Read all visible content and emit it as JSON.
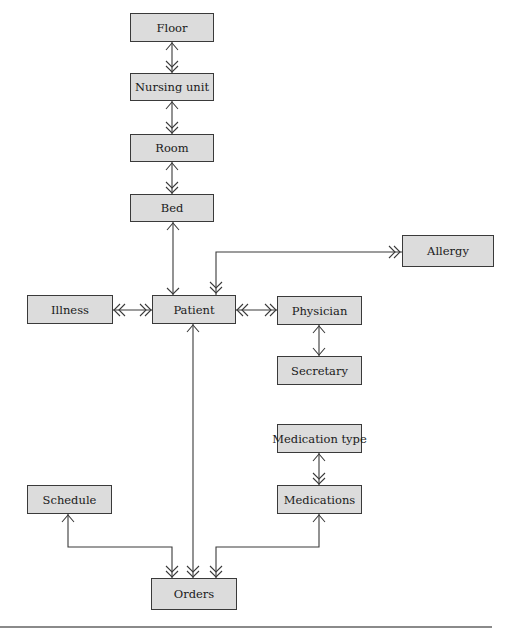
{
  "diagram": {
    "type": "entity-relationship (crow's-foot style)",
    "entities": [
      {
        "id": "floor",
        "label": "Floor",
        "x": 130,
        "y": 13,
        "w": 84,
        "h": 29
      },
      {
        "id": "nursing_unit",
        "label": "Nursing unit",
        "x": 130,
        "y": 73,
        "w": 84,
        "h": 28
      },
      {
        "id": "room",
        "label": "Room",
        "x": 130,
        "y": 134,
        "w": 84,
        "h": 28
      },
      {
        "id": "bed",
        "label": "Bed",
        "x": 130,
        "y": 194,
        "w": 84,
        "h": 28
      },
      {
        "id": "allergy",
        "label": "Allergy",
        "x": 402,
        "y": 235,
        "w": 92,
        "h": 32
      },
      {
        "id": "illness",
        "label": "Illness",
        "x": 27,
        "y": 295,
        "w": 86,
        "h": 29
      },
      {
        "id": "patient",
        "label": "Patient",
        "x": 152,
        "y": 295,
        "w": 84,
        "h": 29
      },
      {
        "id": "physician",
        "label": "Physician",
        "x": 277,
        "y": 296,
        "w": 85,
        "h": 29
      },
      {
        "id": "secretary",
        "label": "Secretary",
        "x": 277,
        "y": 356,
        "w": 85,
        "h": 29
      },
      {
        "id": "medication_type",
        "label": "Medication type",
        "x": 277,
        "y": 424,
        "w": 85,
        "h": 29
      },
      {
        "id": "schedule",
        "label": "Schedule",
        "x": 27,
        "y": 485,
        "w": 85,
        "h": 29
      },
      {
        "id": "medications",
        "label": "Medications",
        "x": 277,
        "y": 485,
        "w": 85,
        "h": 29
      },
      {
        "id": "orders",
        "label": "Orders",
        "x": 151,
        "y": 578,
        "w": 86,
        "h": 32
      }
    ],
    "relationships": [
      {
        "from": "floor",
        "to": "nursing_unit",
        "cardinality": "one-to-many"
      },
      {
        "from": "nursing_unit",
        "to": "room",
        "cardinality": "one-to-many"
      },
      {
        "from": "room",
        "to": "bed",
        "cardinality": "one-to-many"
      },
      {
        "from": "bed",
        "to": "patient",
        "cardinality": "one-to-one"
      },
      {
        "from": "patient",
        "to": "allergy",
        "cardinality": "many-to-many"
      },
      {
        "from": "illness",
        "to": "patient",
        "cardinality": "many-to-many"
      },
      {
        "from": "patient",
        "to": "physician",
        "cardinality": "many-to-many"
      },
      {
        "from": "physician",
        "to": "secretary",
        "cardinality": "one-to-one"
      },
      {
        "from": "medication_type",
        "to": "medications",
        "cardinality": "one-to-many"
      },
      {
        "from": "patient",
        "to": "orders",
        "cardinality": "one-to-many"
      },
      {
        "from": "schedule",
        "to": "orders",
        "cardinality": "one-to-many"
      },
      {
        "from": "medications",
        "to": "orders",
        "cardinality": "one-to-many"
      }
    ]
  },
  "colors": {
    "entity_fill": "#dcdcdc",
    "entity_border": "#3a3a3a",
    "line": "#3a3a3a",
    "bottom_rule": "#8a8a8a"
  }
}
